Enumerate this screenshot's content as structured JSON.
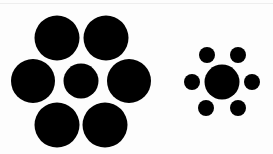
{
  "figure": {
    "background": "#ffffff",
    "fill": "#000000"
  },
  "clusters": [
    {
      "name": "large-surround",
      "center": {
        "cx": 81,
        "cy": 81,
        "r": 17.5
      },
      "surround": [
        {
          "cx": 57,
          "cy": 38,
          "r": 22.5
        },
        {
          "cx": 106,
          "cy": 38,
          "r": 22.5
        },
        {
          "cx": 33,
          "cy": 81,
          "r": 22
        },
        {
          "cx": 129,
          "cy": 81,
          "r": 22
        },
        {
          "cx": 57,
          "cy": 125,
          "r": 22.5
        },
        {
          "cx": 105,
          "cy": 125,
          "r": 22.5
        }
      ]
    },
    {
      "name": "small-surround",
      "center": {
        "cx": 222,
        "cy": 82,
        "r": 17.5
      },
      "surround": [
        {
          "cx": 207,
          "cy": 55,
          "r": 8
        },
        {
          "cx": 238,
          "cy": 55,
          "r": 8
        },
        {
          "cx": 192,
          "cy": 82,
          "r": 8
        },
        {
          "cx": 252,
          "cy": 82,
          "r": 8
        },
        {
          "cx": 206,
          "cy": 108,
          "r": 8
        },
        {
          "cx": 238,
          "cy": 108,
          "r": 8
        }
      ]
    }
  ]
}
